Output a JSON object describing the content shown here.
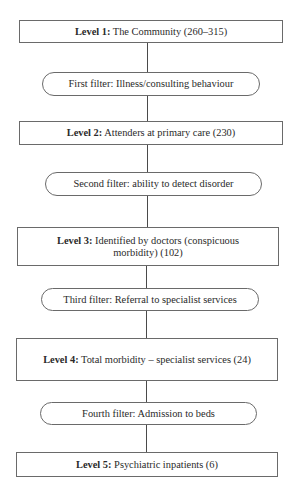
{
  "diagram": {
    "type": "flowchart",
    "orientation": "vertical",
    "nodes": [
      {
        "id": "level1",
        "shape": "rectangle",
        "label_bold": "Level 1:",
        "label_text": " The Community (260–315)"
      },
      {
        "id": "filter1",
        "shape": "rounded",
        "label_text": "First filter: Illness/consulting behaviour"
      },
      {
        "id": "level2",
        "shape": "rectangle",
        "label_bold": "Level 2:",
        "label_text": " Attenders at primary care (230)"
      },
      {
        "id": "filter2",
        "shape": "rounded",
        "label_text": "Second filter: ability to detect disorder"
      },
      {
        "id": "level3",
        "shape": "rectangle",
        "label_bold": "Level 3:",
        "label_text": " Identified by doctors (conspicuous morbidity) (102)"
      },
      {
        "id": "filter3",
        "shape": "rounded",
        "label_text": "Third filter: Referral to specialist services"
      },
      {
        "id": "level4",
        "shape": "rectangle",
        "label_bold": "Level 4:",
        "label_text": " Total morbidity – specialist services (24)"
      },
      {
        "id": "filter4",
        "shape": "rounded",
        "label_text": "Fourth filter: Admission to beds"
      },
      {
        "id": "level5",
        "shape": "rectangle",
        "label_bold": "Level 5:",
        "label_text": " Psychiatric inpatients (6)"
      }
    ],
    "edges": [
      [
        "level1",
        "filter1"
      ],
      [
        "filter1",
        "level2"
      ],
      [
        "level2",
        "filter2"
      ],
      [
        "filter2",
        "level3"
      ],
      [
        "level3",
        "filter3"
      ],
      [
        "filter3",
        "level4"
      ],
      [
        "level4",
        "filter4"
      ],
      [
        "filter4",
        "level5"
      ]
    ]
  }
}
